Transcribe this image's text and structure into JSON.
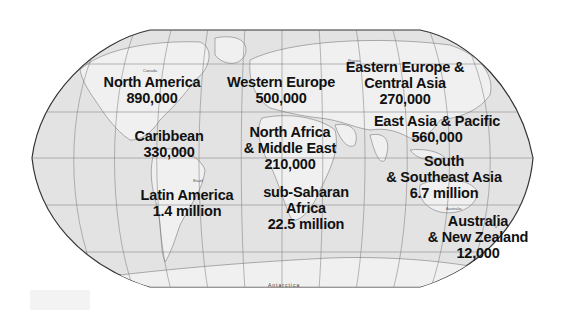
{
  "map": {
    "projection": "Robinson world map (grayscale)",
    "background_color": "#ffffff",
    "ocean_color": "#e4e4e4",
    "land_color": "#eeeeee",
    "border_color": "#444444",
    "label_color": "#111111"
  },
  "regions": [
    {
      "id": "north-america",
      "lines": [
        "North America",
        "890,000"
      ]
    },
    {
      "id": "western-europe",
      "lines": [
        "Western Europe",
        "500,000"
      ]
    },
    {
      "id": "eastern-europe-central-asia",
      "lines": [
        "Eastern Europe &",
        "Central Asia",
        "270,000"
      ]
    },
    {
      "id": "caribbean",
      "lines": [
        "Caribbean",
        "330,000"
      ]
    },
    {
      "id": "north-africa-middle-east",
      "lines": [
        "North Africa",
        "& Middle East",
        "210,000"
      ]
    },
    {
      "id": "east-asia-pacific",
      "lines": [
        "East Asia & Pacific",
        "560,000"
      ]
    },
    {
      "id": "latin-america",
      "lines": [
        "Latin America",
        "1.4 million"
      ]
    },
    {
      "id": "sub-saharan-africa",
      "lines": [
        "sub-Saharan",
        "Africa",
        "22.5 million"
      ]
    },
    {
      "id": "south-southeast-asia",
      "lines": [
        "South",
        "& Southeast Asia",
        "6.7 million"
      ]
    },
    {
      "id": "australia-new-zealand",
      "lines": [
        "Australia",
        "& New Zealand",
        "12,000"
      ]
    }
  ],
  "base_map_labels": {
    "antarctica": "Antarctica",
    "canada": "Canada",
    "brazil": "Brazil",
    "russia": "Russia",
    "australia": "Australia",
    "north_pacific": "North Pacific Ocean",
    "south_pacific": "South Pacific Ocean",
    "north_atlantic": "North Atlantic Ocean",
    "south_atlantic": "South Atlantic Ocean",
    "indian_ocean": "Indian Ocean"
  }
}
